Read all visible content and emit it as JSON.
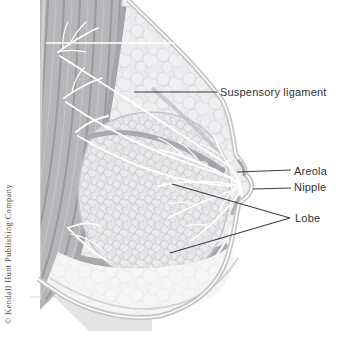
{
  "diagram": {
    "subject_labels": {
      "suspensory_ligament": "Suspensory ligament",
      "areola": "Areola",
      "nipple": "Nipple",
      "lobe": "Lobe"
    },
    "copyright": "© Kendall Hunt Publishing Company",
    "colors": {
      "background": "#ffffff",
      "muscle": "#b6b6b9",
      "muscle_striation": "#9b9b9f",
      "retromammary_band": "#a5a5a9",
      "fat_tissue": "#ebebed",
      "gland_tissue": "#e4e4e7",
      "skin_band": "#c6c6c9",
      "duct_and_ligament": "#ffffff",
      "leader_line": "#3e3e42",
      "label_text": "#333336"
    }
  }
}
